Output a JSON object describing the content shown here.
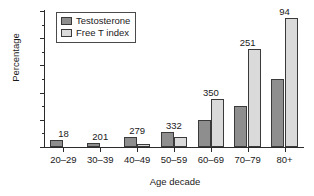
{
  "chart_data": {
    "type": "bar",
    "title": "",
    "xlabel": "Age decade",
    "ylabel": "Percentage",
    "categories": [
      "20–29",
      "30–39",
      "40–49",
      "50–59",
      "60–69",
      "70–79",
      "80+"
    ],
    "series": [
      {
        "name": "Testosterone",
        "color": "#8e8e8e",
        "values": [
          5,
          3,
          7,
          11,
          20,
          30,
          50
        ]
      },
      {
        "name": "Free T index",
        "color": "#dadada",
        "values": [
          0,
          0,
          2.5,
          7.5,
          35,
          72,
          95
        ]
      }
    ],
    "point_labels": [
      "18",
      "201",
      "279",
      "332",
      "350",
      "251",
      "94"
    ],
    "ylim": [
      0,
      100
    ],
    "yticks": [
      0,
      20,
      40,
      60,
      80,
      100
    ],
    "ytick_labels": [
      "0",
      "20",
      "40",
      "60",
      "80",
      "100"
    ],
    "yminor_ticks": [
      10,
      30,
      50,
      70,
      90
    ],
    "grid": false,
    "legend_position": "top-left",
    "legend": [
      "Testosterone",
      "Free T index"
    ]
  }
}
